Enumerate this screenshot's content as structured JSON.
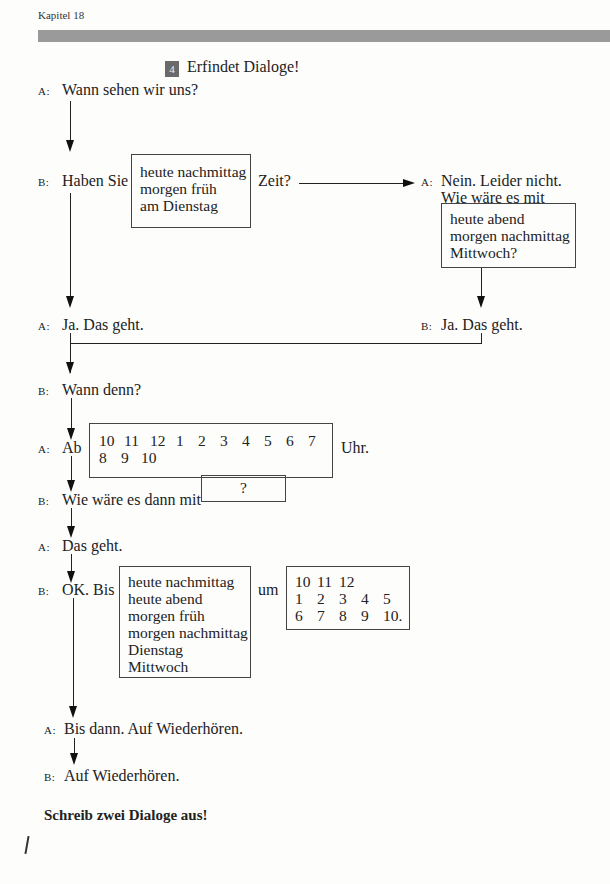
{
  "header": {
    "chapter": "Kapitel 18"
  },
  "exercise": {
    "number": "4",
    "title": "Erfindet Dialoge!"
  },
  "speakers": {
    "a": "A:",
    "b": "B:"
  },
  "dialog": {
    "line1": "Wann sehen wir uns?",
    "line2_pre": "Haben Sie",
    "line2_options": [
      "heute nachmittag",
      "morgen früh",
      "am Dienstag"
    ],
    "line2_post": "Zeit?",
    "right_reply_1": "Nein. Leider nicht.",
    "right_reply_2": "Wie wäre es mit",
    "right_options": [
      "heute abend",
      "morgen nachmittag",
      "Mittwoch?"
    ],
    "left_yes": "Ja. Das geht.",
    "right_yes": "Ja. Das geht.",
    "when": "Wann denn?",
    "from_pre": "Ab",
    "from_times_row1": [
      "10",
      "11",
      "12",
      "1",
      "2",
      "3",
      "4",
      "5",
      "6",
      "7"
    ],
    "from_times_row2": [
      "8",
      "9",
      "10"
    ],
    "from_post": "Uhr.",
    "how_about": "Wie wäre es dann mit",
    "how_about_box": "?",
    "ok": "Das geht.",
    "until_pre": "OK. Bis",
    "until_options": [
      "heute nachmittag",
      "heute abend",
      "morgen früh",
      "morgen nachmittag",
      "Dienstag",
      "Mittwoch"
    ],
    "until_mid": "um",
    "until_times_row1": [
      "10",
      "11",
      "12"
    ],
    "until_times_row2": [
      "1",
      "2",
      "3",
      "4",
      "5"
    ],
    "until_times_row3": [
      "6",
      "7",
      "8",
      "9",
      "10."
    ],
    "bye_a": "Bis dann. Auf Wiederhören.",
    "bye_b": "Auf Wiederhören."
  },
  "instruction": "Schreib zwei Dialoge aus!"
}
